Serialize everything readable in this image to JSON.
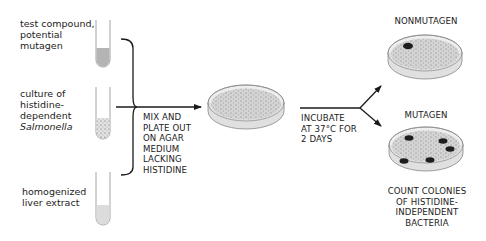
{
  "inputs": [
    {
      "id": "test-compound",
      "lines": [
        "test compound,",
        "potential",
        "mutagen"
      ],
      "fill": "#b4b4b4",
      "pattern": "solid"
    },
    {
      "id": "bacteria-culture",
      "lines": [
        "culture of",
        "histidine-",
        "dependent",
        "Salmonella"
      ],
      "fill": "#e8e8e8",
      "pattern": "dotted"
    },
    {
      "id": "liver-extract",
      "lines": [
        "homogenized",
        "liver extract"
      ],
      "fill": "#dcdcdc",
      "pattern": "solid"
    }
  ],
  "step1": {
    "lines": [
      "MIX AND",
      "PLATE OUT",
      "ON AGAR",
      "MEDIUM",
      "LACKING",
      "HISTIDINE"
    ]
  },
  "step2": {
    "lines": [
      "INCUBATE",
      "AT 37°C FOR",
      "2 DAYS"
    ]
  },
  "outcomes": {
    "nonmutagen": {
      "label": "NONMUTAGEN",
      "colonies": 1
    },
    "mutagen": {
      "label": "MUTAGEN",
      "colonies": 5,
      "caption": [
        "COUNT COLONIES",
        "OF HISTIDINE-",
        "INDEPENDENT",
        "BACTERIA"
      ]
    }
  },
  "colors": {
    "line": "#1a1a1a",
    "tube_outline": "#9a9a9a",
    "plate_fill": "#d6d6d6",
    "colony": "#1e1e1e"
  }
}
